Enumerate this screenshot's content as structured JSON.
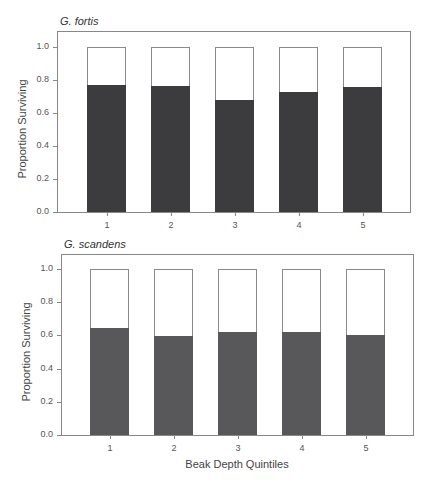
{
  "chart_data": [
    {
      "type": "bar",
      "stacked": true,
      "title": "G. fortis",
      "xlabel": "",
      "ylabel": "Proportion Surviving",
      "categories": [
        "1",
        "2",
        "3",
        "4",
        "5"
      ],
      "series": [
        {
          "name": "Surviving",
          "values": [
            0.77,
            0.765,
            0.68,
            0.725,
            0.755
          ],
          "color": "#3c3c3e"
        },
        {
          "name": "Not surviving",
          "values": [
            0.23,
            0.235,
            0.32,
            0.275,
            0.245
          ],
          "color": "#ffffff"
        }
      ],
      "ylim": [
        0,
        1.0
      ],
      "yticks": [
        "0.0",
        "0.2",
        "0.4",
        "0.6",
        "0.8",
        "1.0"
      ],
      "grid": false
    },
    {
      "type": "bar",
      "stacked": true,
      "title": "G. scandens",
      "xlabel": "Beak Depth Quintiles",
      "ylabel": "Proportion Surviving",
      "categories": [
        "1",
        "2",
        "3",
        "4",
        "5"
      ],
      "series": [
        {
          "name": "Surviving",
          "values": [
            0.645,
            0.595,
            0.62,
            0.62,
            0.6
          ],
          "color": "#58585a"
        },
        {
          "name": "Not surviving",
          "values": [
            0.355,
            0.405,
            0.38,
            0.38,
            0.4
          ],
          "color": "#ffffff"
        }
      ],
      "ylim": [
        0,
        1.0
      ],
      "yticks": [
        "0.0",
        "0.2",
        "0.4",
        "0.6",
        "0.8",
        "1.0"
      ],
      "grid": false
    }
  ],
  "layout": {
    "panels": [
      {
        "frame": {
          "left": 57,
          "top": 31,
          "right": 411,
          "bottom": 213
        },
        "y0": 212,
        "y1": 47,
        "bar_lefts": [
          87,
          151,
          215,
          279,
          343
        ],
        "bar_width": 39,
        "title_pos": {
          "left": 60,
          "top": 15
        },
        "ylabel_center": {
          "x": 22,
          "y": 130
        }
      },
      {
        "frame": {
          "left": 61,
          "top": 254,
          "right": 414,
          "bottom": 436
        },
        "y0": 435,
        "y1": 269,
        "bar_lefts": [
          90,
          154,
          218,
          282,
          346
        ],
        "bar_width": 39,
        "title_pos": {
          "left": 64,
          "top": 238
        },
        "ylabel_center": {
          "x": 26,
          "y": 353
        },
        "xlabel_pos": {
          "center": 237,
          "top": 458
        }
      }
    ]
  }
}
